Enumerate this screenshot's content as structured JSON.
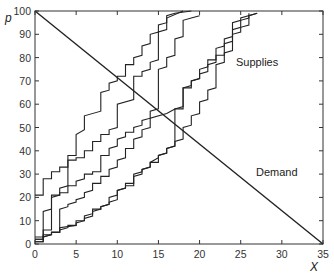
{
  "chart_data": {
    "type": "line",
    "title": "",
    "xlabel": "X",
    "ylabel": "p",
    "xlim": [
      0,
      35
    ],
    "ylim": [
      0,
      100
    ],
    "xticks": [
      "0",
      "5",
      "10",
      "15",
      "20",
      "25",
      "30",
      "35"
    ],
    "yticks": [
      "0",
      "10",
      "20",
      "30",
      "40",
      "50",
      "60",
      "70",
      "80",
      "90",
      "100"
    ],
    "grid": false,
    "legend": "none",
    "annotations": [
      {
        "text": "Supplies",
        "x": 27.5,
        "y": 78
      },
      {
        "text": "Demand",
        "x": 30,
        "y": 31
      }
    ],
    "series": [
      {
        "name": "Demand",
        "points": [
          [
            0,
            100
          ],
          [
            35,
            0
          ]
        ]
      },
      {
        "name": "Supply 1",
        "points": [
          [
            0,
            21
          ],
          [
            1,
            21
          ],
          [
            1,
            28
          ],
          [
            2,
            28
          ],
          [
            2,
            31
          ],
          [
            3,
            31
          ],
          [
            3,
            33
          ],
          [
            4,
            33
          ],
          [
            4,
            36
          ],
          [
            5,
            36
          ],
          [
            5,
            37
          ],
          [
            6,
            37
          ],
          [
            6,
            40
          ],
          [
            7,
            40
          ],
          [
            7,
            44
          ],
          [
            8,
            44
          ],
          [
            8,
            47
          ],
          [
            9,
            47
          ],
          [
            9,
            49
          ],
          [
            10,
            50
          ],
          [
            10,
            60
          ],
          [
            12,
            62
          ],
          [
            12,
            72
          ],
          [
            13,
            72
          ],
          [
            13,
            74
          ],
          [
            14,
            75
          ],
          [
            14,
            78
          ],
          [
            15,
            79
          ],
          [
            15,
            91
          ],
          [
            16,
            92
          ],
          [
            16,
            98
          ],
          [
            17,
            99
          ],
          [
            19,
            100
          ]
        ]
      },
      {
        "name": "Supply 2",
        "points": [
          [
            0,
            3
          ],
          [
            1,
            3
          ],
          [
            1,
            14
          ],
          [
            2,
            15
          ],
          [
            2,
            20
          ],
          [
            3,
            21
          ],
          [
            3,
            22
          ],
          [
            4,
            22
          ],
          [
            4,
            25
          ],
          [
            5,
            25
          ],
          [
            5,
            27
          ],
          [
            6,
            28
          ],
          [
            6,
            30
          ],
          [
            7,
            30
          ],
          [
            7,
            31
          ],
          [
            8,
            31
          ],
          [
            8,
            38
          ],
          [
            9,
            38
          ],
          [
            9,
            41
          ],
          [
            10,
            42
          ],
          [
            10,
            45
          ],
          [
            11,
            46
          ],
          [
            11,
            48
          ],
          [
            12,
            48
          ],
          [
            12,
            50
          ],
          [
            13,
            51
          ],
          [
            13,
            53
          ],
          [
            14,
            54
          ],
          [
            14,
            57
          ],
          [
            15,
            58
          ],
          [
            15,
            75
          ],
          [
            16,
            76
          ],
          [
            16,
            80
          ],
          [
            17,
            81
          ],
          [
            17,
            88
          ],
          [
            18,
            89
          ],
          [
            18,
            96
          ],
          [
            19,
            97
          ],
          [
            20,
            98
          ]
        ]
      },
      {
        "name": "Supply 3",
        "points": [
          [
            0,
            2
          ],
          [
            1,
            2
          ],
          [
            1,
            6
          ],
          [
            2,
            6
          ],
          [
            2,
            21
          ],
          [
            3,
            21
          ],
          [
            3,
            24
          ],
          [
            4,
            25
          ],
          [
            4,
            38
          ],
          [
            5,
            38
          ],
          [
            5,
            47
          ],
          [
            6,
            49
          ],
          [
            6,
            55
          ],
          [
            8,
            57
          ],
          [
            8,
            65
          ],
          [
            9,
            66
          ],
          [
            9,
            69
          ],
          [
            10,
            70
          ],
          [
            10,
            72
          ],
          [
            11,
            72
          ],
          [
            11,
            77
          ],
          [
            12,
            77
          ],
          [
            12,
            80
          ],
          [
            13,
            81
          ],
          [
            13,
            85
          ],
          [
            14,
            86
          ],
          [
            14,
            90
          ],
          [
            15,
            91
          ],
          [
            15,
            94
          ],
          [
            16,
            95
          ],
          [
            16,
            97
          ],
          [
            18,
            100
          ]
        ]
      },
      {
        "name": "Supply 4",
        "points": [
          [
            0,
            1
          ],
          [
            1,
            1
          ],
          [
            1,
            4
          ],
          [
            2,
            4
          ],
          [
            2,
            5
          ],
          [
            3,
            5
          ],
          [
            3,
            15
          ],
          [
            4,
            16
          ],
          [
            4,
            17
          ],
          [
            5,
            18
          ],
          [
            5,
            19
          ],
          [
            6,
            20
          ],
          [
            6,
            22
          ],
          [
            7,
            23
          ],
          [
            7,
            26
          ],
          [
            8,
            26
          ],
          [
            8,
            29
          ],
          [
            9,
            29
          ],
          [
            9,
            32
          ],
          [
            10,
            33
          ],
          [
            10,
            36
          ],
          [
            11,
            37
          ],
          [
            11,
            41
          ],
          [
            12,
            41
          ],
          [
            12,
            45
          ],
          [
            13,
            46
          ],
          [
            13,
            49
          ],
          [
            14,
            50
          ],
          [
            14,
            54
          ],
          [
            16,
            56
          ],
          [
            17,
            58
          ],
          [
            17,
            58
          ],
          [
            18,
            59
          ],
          [
            18,
            67
          ],
          [
            19,
            67
          ],
          [
            19,
            70
          ],
          [
            20,
            71
          ],
          [
            20,
            75
          ],
          [
            21,
            76
          ],
          [
            21,
            79
          ],
          [
            22,
            79
          ],
          [
            22,
            84
          ],
          [
            23,
            85
          ],
          [
            23,
            88
          ],
          [
            24,
            89
          ],
          [
            24,
            95
          ],
          [
            25,
            96
          ],
          [
            25,
            97
          ],
          [
            27,
            99
          ]
        ]
      },
      {
        "name": "Supply 5",
        "points": [
          [
            0,
            2
          ],
          [
            1,
            2
          ],
          [
            1,
            3
          ],
          [
            2,
            4
          ],
          [
            2,
            5
          ],
          [
            3,
            5
          ],
          [
            3,
            7
          ],
          [
            5,
            8
          ],
          [
            5,
            10
          ],
          [
            6,
            10
          ],
          [
            6,
            12
          ],
          [
            7,
            13
          ],
          [
            7,
            15
          ],
          [
            8,
            15
          ],
          [
            8,
            16
          ],
          [
            9,
            17
          ],
          [
            9,
            20
          ],
          [
            10,
            21
          ],
          [
            10,
            23
          ],
          [
            11,
            24
          ],
          [
            11,
            26
          ],
          [
            12,
            26
          ],
          [
            12,
            30
          ],
          [
            13,
            31
          ],
          [
            13,
            32
          ],
          [
            14,
            33
          ],
          [
            14,
            35
          ],
          [
            15,
            37
          ],
          [
            15,
            38
          ],
          [
            16,
            39
          ],
          [
            16,
            41
          ],
          [
            17,
            42
          ],
          [
            17,
            58
          ],
          [
            18,
            58
          ],
          [
            18,
            67
          ],
          [
            19,
            68
          ],
          [
            19,
            70
          ],
          [
            20,
            71
          ],
          [
            20,
            73
          ],
          [
            21,
            74
          ],
          [
            21,
            77
          ],
          [
            22,
            78
          ],
          [
            22,
            81
          ],
          [
            23,
            81
          ],
          [
            23,
            86
          ],
          [
            24,
            87
          ],
          [
            24,
            90
          ],
          [
            25,
            91
          ],
          [
            25,
            93
          ],
          [
            26,
            94
          ],
          [
            26,
            98
          ],
          [
            27,
            99
          ]
        ]
      },
      {
        "name": "Supply 6",
        "points": [
          [
            0,
            1
          ],
          [
            1,
            1
          ],
          [
            1,
            3
          ],
          [
            2,
            4
          ],
          [
            2,
            5
          ],
          [
            3,
            5
          ],
          [
            3,
            6
          ],
          [
            4,
            7
          ],
          [
            4,
            8
          ],
          [
            5,
            8
          ],
          [
            5,
            9
          ],
          [
            6,
            10
          ],
          [
            6,
            11
          ],
          [
            7,
            12
          ],
          [
            7,
            14
          ],
          [
            8,
            15
          ],
          [
            8,
            16
          ],
          [
            9,
            17
          ],
          [
            9,
            18
          ],
          [
            10,
            19
          ],
          [
            10,
            23
          ],
          [
            11,
            24
          ],
          [
            11,
            25
          ],
          [
            12,
            25
          ],
          [
            12,
            29
          ],
          [
            13,
            30
          ],
          [
            13,
            32
          ],
          [
            14,
            33
          ],
          [
            14,
            35
          ],
          [
            15,
            35
          ],
          [
            15,
            38
          ],
          [
            16,
            39
          ],
          [
            16,
            41
          ],
          [
            17,
            42
          ],
          [
            17,
            44
          ],
          [
            18,
            45
          ],
          [
            18,
            50
          ],
          [
            19,
            51
          ],
          [
            19,
            55
          ],
          [
            20,
            56
          ],
          [
            20,
            61
          ],
          [
            21,
            62
          ],
          [
            21,
            66
          ],
          [
            22,
            67
          ],
          [
            22,
            77
          ],
          [
            23,
            78
          ],
          [
            23,
            82
          ],
          [
            24,
            83
          ],
          [
            24,
            92
          ],
          [
            25,
            93
          ],
          [
            25,
            96
          ],
          [
            26,
            97
          ],
          [
            26,
            99
          ]
        ]
      }
    ]
  }
}
